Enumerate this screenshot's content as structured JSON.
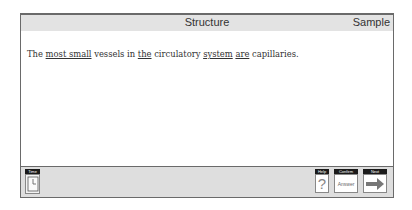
{
  "header": {
    "title": "Structure",
    "mode": "Sample"
  },
  "question": {
    "parts": [
      {
        "text": "The ",
        "underline": false
      },
      {
        "text": "most small",
        "underline": true
      },
      {
        "text": " vessels in ",
        "underline": false
      },
      {
        "text": "the",
        "underline": true
      },
      {
        "text": " circulatory ",
        "underline": false
      },
      {
        "text": "system",
        "underline": true
      },
      {
        "text": " ",
        "underline": false
      },
      {
        "text": "are",
        "underline": true
      },
      {
        "text": " capillaries.",
        "underline": false
      }
    ]
  },
  "footer": {
    "time_label": "Time",
    "help_label": "Help",
    "help_glyph": "?",
    "confirm_label": "Confirm",
    "confirm_button": "Answer",
    "next_label": "Next"
  }
}
